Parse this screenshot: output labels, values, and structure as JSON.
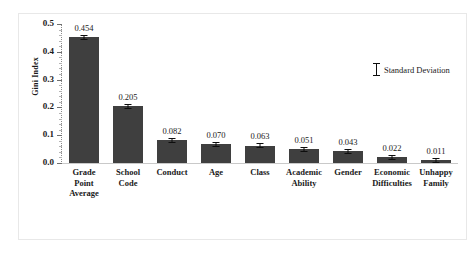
{
  "chart_data": {
    "type": "bar",
    "title": "",
    "xlabel": "",
    "ylabel": "Gini Index",
    "ylim": [
      0.0,
      0.5
    ],
    "ytick_labels": [
      "0.0",
      "0.1",
      "0.2",
      "0.3",
      "0.4",
      "0.5"
    ],
    "ytick_values": [
      0.0,
      0.1,
      0.2,
      0.3,
      0.4,
      0.5
    ],
    "grid": false,
    "legend_position": "upper-right-inside",
    "categories": [
      "Grade Point Average",
      "School Code",
      "Conduct",
      "Age",
      "Class",
      "Academic Ability",
      "Gender",
      "Economic Difficulties",
      "Unhappy Family"
    ],
    "values": [
      0.454,
      0.205,
      0.082,
      0.07,
      0.063,
      0.051,
      0.043,
      0.022,
      0.011
    ],
    "value_labels": [
      "0.454",
      "0.205",
      "0.082",
      "0.070",
      "0.063",
      "0.051",
      "0.043",
      "0.022",
      "0.011"
    ],
    "errors": [
      0.006,
      0.004,
      0.003,
      0.003,
      0.002,
      0.003,
      0.003,
      0.002,
      0.002
    ],
    "bar_color": "#3f3f3f",
    "error_bar_color": "#0d0d0d"
  },
  "legend": {
    "entries": [
      {
        "label": "Standard Deviation",
        "marker": "error-bar-i-beam"
      }
    ]
  },
  "category_lines": [
    [
      "Grade",
      "Point",
      "Average"
    ],
    [
      "School",
      "Code"
    ],
    [
      "Conduct"
    ],
    [
      "Age"
    ],
    [
      "Class"
    ],
    [
      "Academic",
      "Ability"
    ],
    [
      "Gender"
    ],
    [
      "Economic",
      "Difficulties"
    ],
    [
      "Unhappy",
      "Family"
    ]
  ]
}
